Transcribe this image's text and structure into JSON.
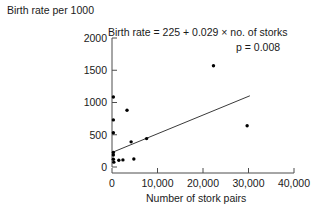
{
  "chart_data": {
    "type": "scatter",
    "title": "",
    "xlabel": "Number of stork pairs",
    "ylabel": "Birth rate per 1000",
    "xlim": [
      0,
      40000
    ],
    "ylim": [
      0,
      2000
    ],
    "xticks": [
      0,
      10000,
      20000,
      30000,
      40000
    ],
    "xtick_labels": [
      "0",
      "10,000",
      "20,000",
      "30,000",
      "40,000"
    ],
    "yticks": [
      0,
      500,
      1000,
      1500,
      2000
    ],
    "ytick_labels": [
      "0",
      "500",
      "1000",
      "1500",
      "2000"
    ],
    "grid": false,
    "legend": null,
    "annotations": [
      {
        "name": "regression-equation",
        "text": "Birth rate = 225 + 0.029 × no. of storks"
      },
      {
        "name": "p-value",
        "text": "p = 0.008"
      }
    ],
    "fit_line": {
      "name": "regression-line",
      "intercept": 225,
      "slope": 0.029,
      "x_start": 0,
      "x_end": 30300,
      "y_start": 225,
      "y_end": 1104
    },
    "points": [
      {
        "x": 300,
        "y": 1085
      },
      {
        "x": 300,
        "y": 730
      },
      {
        "x": 3300,
        "y": 880
      },
      {
        "x": 300,
        "y": 530
      },
      {
        "x": 22300,
        "y": 1570
      },
      {
        "x": 300,
        "y": 225
      },
      {
        "x": 300,
        "y": 185
      },
      {
        "x": 300,
        "y": 120
      },
      {
        "x": 400,
        "y": 75
      },
      {
        "x": 1500,
        "y": 105
      },
      {
        "x": 2400,
        "y": 110
      },
      {
        "x": 4800,
        "y": 125
      },
      {
        "x": 4200,
        "y": 390
      },
      {
        "x": 7600,
        "y": 440
      },
      {
        "x": 29700,
        "y": 640
      }
    ]
  }
}
